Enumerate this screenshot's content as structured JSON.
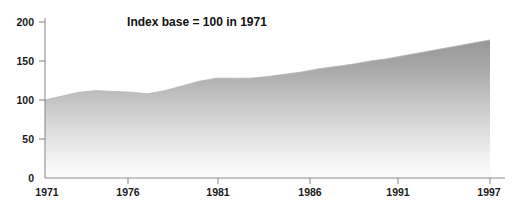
{
  "chart_data": {
    "type": "area",
    "title": "",
    "subtitle": "",
    "annotation": "Index base = 100 in 1971",
    "xlabel": "",
    "ylabel": "",
    "xlim": [
      1971,
      1997
    ],
    "ylim": [
      0,
      200
    ],
    "grid": false,
    "legend": "none",
    "y_ticks": [
      "0",
      "50",
      "100",
      "150",
      "200"
    ],
    "y_tick_values": [
      0,
      50,
      100,
      150,
      200
    ],
    "x_ticks": [
      "1971",
      "1976",
      "1981",
      "1986",
      "1991",
      "1997"
    ],
    "x_tick_values": [
      1971,
      1976,
      1981,
      1986,
      1991,
      1997
    ],
    "series": [
      {
        "name": "Index",
        "x": [
          1971,
          1972,
          1973,
          1974,
          1975,
          1976,
          1977,
          1978,
          1979,
          1980,
          1981,
          1982,
          1983,
          1984,
          1985,
          1986,
          1987,
          1988,
          1989,
          1990,
          1991,
          1992,
          1993,
          1994,
          1995,
          1996,
          1997
        ],
        "values": [
          100,
          105,
          110,
          112,
          111,
          110,
          108,
          112,
          118,
          124,
          128,
          128,
          128,
          130,
          133,
          136,
          140,
          143,
          146,
          150,
          153,
          157,
          161,
          165,
          169,
          173,
          177
        ]
      }
    ],
    "colors": {
      "area_top": "#9a9a9a",
      "area_bottom": "#fbfbfb",
      "axis": "#8d8d8d",
      "text": "#1a1a1a",
      "background": "#ffffff"
    }
  },
  "axes": {
    "y_tick_0": "0",
    "y_tick_1": "50",
    "y_tick_2": "100",
    "y_tick_3": "150",
    "y_tick_4": "200",
    "x_tick_0": "1971",
    "x_tick_1": "1976",
    "x_tick_2": "1981",
    "x_tick_3": "1986",
    "x_tick_4": "1991",
    "x_tick_5": "1997"
  },
  "annotation": {
    "text": "Index base = 100 in 1971"
  }
}
